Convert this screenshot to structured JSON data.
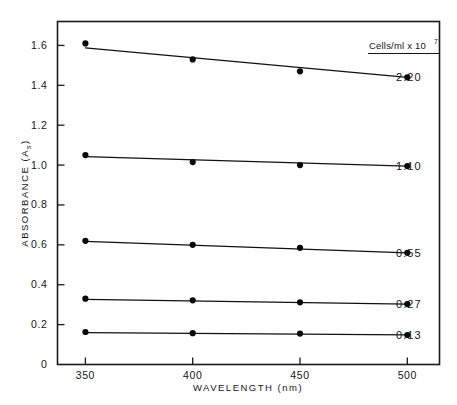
{
  "chart_data": {
    "type": "line",
    "title": "",
    "subtitle": "",
    "xlabel": "WAVELENGTH  (nm)",
    "ylabel": "ABSORBANCE  (A",
    "ylabel_sub": "s",
    "ylabel_tail": ")",
    "x": [
      350,
      400,
      450,
      500
    ],
    "xlim": [
      337,
      515
    ],
    "ylim": [
      0,
      1.72
    ],
    "grid": false,
    "legend_position": "right-of-plot",
    "legend_title_main": "Cells/ml x 10",
    "legend_title_exp": "7",
    "xticks": [
      {
        "value": 350,
        "label": "350"
      },
      {
        "value": 400,
        "label": "400"
      },
      {
        "value": 450,
        "label": "450"
      },
      {
        "value": 500,
        "label": "500"
      }
    ],
    "yticks": [
      {
        "value": 0,
        "label": "0"
      },
      {
        "value": 0.2,
        "label": "0.2"
      },
      {
        "value": 0.4,
        "label": "0.4"
      },
      {
        "value": 0.6,
        "label": "0.6"
      },
      {
        "value": 0.8,
        "label": "0.8"
      },
      {
        "value": 1.0,
        "label": "1.0"
      },
      {
        "value": 1.2,
        "label": "1.2"
      },
      {
        "value": 1.4,
        "label": "1.4"
      },
      {
        "value": 1.6,
        "label": "1.6"
      }
    ],
    "series": [
      {
        "name": "2.20",
        "label": "2.20",
        "values": [
          1.61,
          1.53,
          1.47,
          1.44
        ]
      },
      {
        "name": "1.10",
        "label": "1.10",
        "values": [
          1.05,
          1.015,
          1.0,
          0.995
        ]
      },
      {
        "name": "0.55",
        "label": "0.55",
        "values": [
          0.62,
          0.6,
          0.585,
          0.56
        ]
      },
      {
        "name": "0.27",
        "label": "0.27",
        "values": [
          0.33,
          0.322,
          0.312,
          0.303
        ]
      },
      {
        "name": "0.13",
        "label": "0.13",
        "values": [
          0.163,
          0.157,
          0.155,
          0.148
        ]
      }
    ]
  }
}
